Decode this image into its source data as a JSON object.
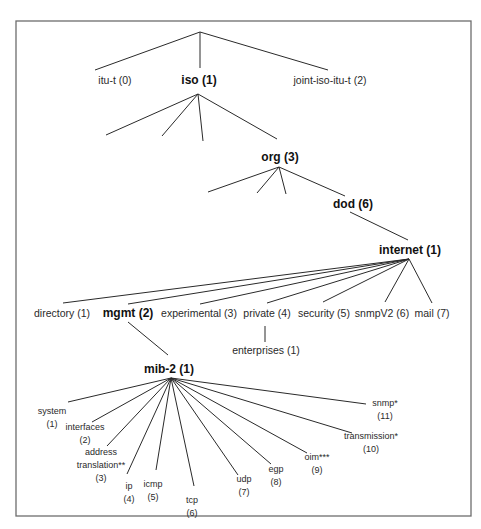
{
  "diagram": {
    "title": "",
    "frame": {
      "x": 16,
      "y": 21,
      "width": 455,
      "height": 495,
      "color": "#6d6d6d"
    },
    "root": {
      "x": 200,
      "y": 32
    },
    "nodes": {
      "itu_t": {
        "label": "itu-t (0)",
        "x": 115,
        "y": 84,
        "style": "normal"
      },
      "iso": {
        "label": "iso (1)",
        "x": 199,
        "y": 84,
        "style": "bold"
      },
      "joint_iso_itu_t": {
        "label": "joint-iso-itu-t (2)",
        "x": 330,
        "y": 84,
        "style": "normal"
      },
      "org": {
        "label": "org (3)",
        "x": 280,
        "y": 161,
        "style": "bold"
      },
      "dod": {
        "label": "dod (6)",
        "x": 353,
        "y": 208,
        "style": "bold"
      },
      "internet": {
        "label": "internet (1)",
        "x": 410,
        "y": 254,
        "style": "bold"
      },
      "directory": {
        "label": "directory (1)",
        "x": 62,
        "y": 317,
        "style": "normal"
      },
      "mgmt": {
        "label": "mgmt (2)",
        "x": 128,
        "y": 317,
        "style": "bold"
      },
      "experimental": {
        "label": "experimental (3)",
        "x": 199,
        "y": 317,
        "style": "normal"
      },
      "private": {
        "label": "private (4)",
        "x": 267,
        "y": 317,
        "style": "normal"
      },
      "security": {
        "label": "security (5)",
        "x": 324,
        "y": 317,
        "style": "normal"
      },
      "snmpV2": {
        "label": "snmpV2 (6)",
        "x": 382,
        "y": 317,
        "style": "normal"
      },
      "mail": {
        "label": "mail (7)",
        "x": 432,
        "y": 317,
        "style": "normal"
      },
      "enterprises": {
        "label": "enterprises (1)",
        "x": 266,
        "y": 354,
        "style": "normal"
      },
      "mib2": {
        "label": "mib-2 (1)",
        "x": 169,
        "y": 373,
        "style": "bold"
      }
    },
    "mib2_children": [
      {
        "name": "system",
        "lines": [
          "system",
          "(1)"
        ],
        "x": 52,
        "y": 414
      },
      {
        "name": "interfaces",
        "lines": [
          "interfaces",
          "(2)"
        ],
        "x": 85,
        "y": 430
      },
      {
        "name": "address-translation",
        "lines": [
          "address",
          "translation**",
          "(3)"
        ],
        "x": 101,
        "y": 455
      },
      {
        "name": "ip",
        "lines": [
          "ip",
          "(4)"
        ],
        "x": 129,
        "y": 489
      },
      {
        "name": "icmp",
        "lines": [
          "icmp",
          "(5)"
        ],
        "x": 153,
        "y": 487
      },
      {
        "name": "tcp",
        "lines": [
          "tcp",
          "(6)"
        ],
        "x": 192,
        "y": 503
      },
      {
        "name": "udp",
        "lines": [
          "udp",
          "(7)"
        ],
        "x": 244,
        "y": 482
      },
      {
        "name": "egp",
        "lines": [
          "egp",
          "(8)"
        ],
        "x": 276,
        "y": 472
      },
      {
        "name": "oim",
        "lines": [
          "oim***",
          "(9)"
        ],
        "x": 317,
        "y": 460
      },
      {
        "name": "transmission",
        "lines": [
          "transmission*",
          "(10)"
        ],
        "x": 371,
        "y": 439
      },
      {
        "name": "snmp",
        "lines": [
          "snmp*",
          "(11)"
        ],
        "x": 385,
        "y": 406
      }
    ],
    "edges": [
      {
        "from": [
          200,
          32
        ],
        "to": [
          95,
          70
        ]
      },
      {
        "from": [
          200,
          32
        ],
        "to": [
          200,
          68
        ]
      },
      {
        "from": [
          200,
          32
        ],
        "to": [
          328,
          70
        ]
      },
      {
        "from": [
          198,
          94
        ],
        "to": [
          106,
          135
        ]
      },
      {
        "from": [
          198,
          94
        ],
        "to": [
          162,
          136
        ]
      },
      {
        "from": [
          198,
          94
        ],
        "to": [
          203,
          141
        ]
      },
      {
        "from": [
          198,
          94
        ],
        "to": [
          277,
          139
        ]
      },
      {
        "from": [
          279,
          167
        ],
        "to": [
          208,
          192
        ]
      },
      {
        "from": [
          279,
          167
        ],
        "to": [
          257,
          193
        ]
      },
      {
        "from": [
          279,
          167
        ],
        "to": [
          286,
          194
        ]
      },
      {
        "from": [
          279,
          167
        ],
        "to": [
          345,
          196
        ]
      },
      {
        "from": [
          350,
          212
        ],
        "to": [
          408,
          240
        ]
      },
      {
        "from": [
          409,
          259
        ],
        "to": [
          63,
          303
        ]
      },
      {
        "from": [
          409,
          259
        ],
        "to": [
          128,
          304
        ]
      },
      {
        "from": [
          409,
          259
        ],
        "to": [
          200,
          304
        ]
      },
      {
        "from": [
          409,
          259
        ],
        "to": [
          267,
          303
        ]
      },
      {
        "from": [
          409,
          259
        ],
        "to": [
          323,
          302
        ]
      },
      {
        "from": [
          409,
          259
        ],
        "to": [
          385,
          302
        ]
      },
      {
        "from": [
          409,
          259
        ],
        "to": [
          432,
          303
        ]
      },
      {
        "from": [
          265,
          326
        ],
        "to": [
          265,
          342
        ]
      },
      {
        "from": [
          128,
          322
        ],
        "to": [
          168,
          355
        ]
      },
      {
        "from": [
          171,
          378
        ],
        "to": [
          68,
          402
        ]
      },
      {
        "from": [
          171,
          378
        ],
        "to": [
          92,
          422
        ]
      },
      {
        "from": [
          171,
          378
        ],
        "to": [
          107,
          446
        ]
      },
      {
        "from": [
          171,
          378
        ],
        "to": [
          127,
          474
        ]
      },
      {
        "from": [
          171,
          378
        ],
        "to": [
          156,
          470
        ]
      },
      {
        "from": [
          171,
          378
        ],
        "to": [
          194,
          486
        ]
      },
      {
        "from": [
          171,
          378
        ],
        "to": [
          238,
          475
        ]
      },
      {
        "from": [
          171,
          378
        ],
        "to": [
          271,
          464
        ]
      },
      {
        "from": [
          171,
          378
        ],
        "to": [
          307,
          453
        ]
      },
      {
        "from": [
          171,
          378
        ],
        "to": [
          352,
          433
        ]
      },
      {
        "from": [
          171,
          378
        ],
        "to": [
          366,
          404
        ]
      }
    ]
  }
}
